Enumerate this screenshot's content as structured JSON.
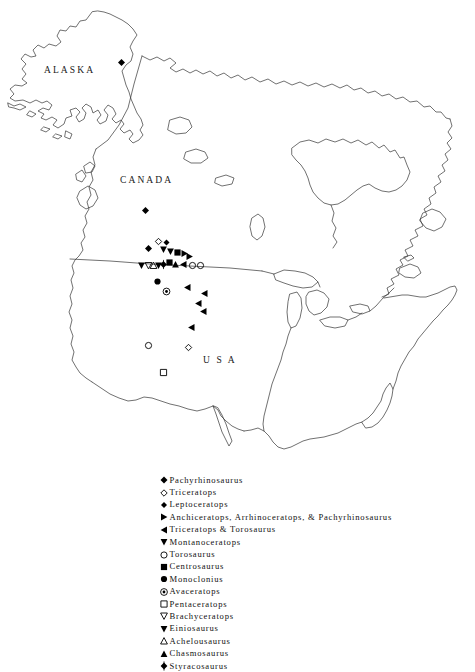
{
  "map": {
    "title": "North American ceratopsian dinosaur fossil localities",
    "background_color": "#ffffff",
    "line_color": "#333333",
    "marker_color": "#000000",
    "region_labels": [
      {
        "name": "alaska",
        "text": "ALASKA"
      },
      {
        "name": "canada",
        "text": "CANADA"
      },
      {
        "name": "usa",
        "text": "U S A"
      }
    ],
    "markers": [
      {
        "symbol": "filled-diamond",
        "taxon": "Pachyrhinosaurus",
        "x": 121,
        "y": 62
      },
      {
        "symbol": "filled-diamond",
        "taxon": "Pachyrhinosaurus",
        "x": 145,
        "y": 210
      },
      {
        "symbol": "filled-diamond",
        "taxon": "Pachyrhinosaurus",
        "x": 148,
        "y": 248
      },
      {
        "symbol": "open-diamond",
        "taxon": "Triceratops",
        "x": 158,
        "y": 241
      },
      {
        "symbol": "filled-diamond-small",
        "taxon": "Leptoceratops",
        "x": 166,
        "y": 242
      },
      {
        "symbol": "filled-down-triangle",
        "taxon": "Montanoceratops",
        "x": 163,
        "y": 249
      },
      {
        "symbol": "filled-down-triangle",
        "taxon": "Montanoceratops",
        "x": 170,
        "y": 251
      },
      {
        "symbol": "filled-square",
        "taxon": "Centrosaurus",
        "x": 177,
        "y": 252
      },
      {
        "symbol": "filled-right-triangle",
        "taxon": "Anchiceratops, Arrhinoceratops, & Pachyrhinosaurus",
        "x": 184,
        "y": 253
      },
      {
        "symbol": "filled-right-triangle",
        "taxon": "Anchiceratops, Arrhinoceratops, & Pachyrhinosaurus",
        "x": 189,
        "y": 256
      },
      {
        "symbol": "filled-down-triangle",
        "taxon": "Montanoceratops",
        "x": 141,
        "y": 265
      },
      {
        "symbol": "open-down-triangle",
        "taxon": "Brachyceratops",
        "x": 148,
        "y": 265
      },
      {
        "symbol": "open-up-triangle",
        "taxon": "Achelousaurus",
        "x": 153,
        "y": 265
      },
      {
        "symbol": "filled-down-triangle",
        "taxon": "Einiosaurus",
        "x": 158,
        "y": 265
      },
      {
        "symbol": "styracosaurus-diamond",
        "taxon": "Styracosaurus",
        "x": 163,
        "y": 264
      },
      {
        "symbol": "filled-square",
        "taxon": "Centrosaurus",
        "x": 169,
        "y": 262
      },
      {
        "symbol": "filled-up-triangle",
        "taxon": "Chasmosaurus",
        "x": 175,
        "y": 264
      },
      {
        "symbol": "filled-left-triangle",
        "taxon": "Triceratops & Torosaurus",
        "x": 183,
        "y": 264
      },
      {
        "symbol": "open-circle",
        "taxon": "Torosaurus",
        "x": 192,
        "y": 265
      },
      {
        "symbol": "open-circle",
        "taxon": "Torosaurus",
        "x": 200,
        "y": 265
      },
      {
        "symbol": "filled-circle",
        "taxon": "Monoclonius",
        "x": 157,
        "y": 281
      },
      {
        "symbol": "avaceratops-circle",
        "taxon": "Avaceratops",
        "x": 166,
        "y": 291
      },
      {
        "symbol": "filled-left-triangle",
        "taxon": "Triceratops & Torosaurus",
        "x": 187,
        "y": 287
      },
      {
        "symbol": "filled-left-triangle",
        "taxon": "Triceratops & Torosaurus",
        "x": 204,
        "y": 293
      },
      {
        "symbol": "filled-left-triangle",
        "taxon": "Triceratops & Torosaurus",
        "x": 198,
        "y": 303
      },
      {
        "symbol": "filled-left-triangle",
        "taxon": "Triceratops & Torosaurus",
        "x": 203,
        "y": 311
      },
      {
        "symbol": "filled-left-triangle",
        "taxon": "Triceratops & Torosaurus",
        "x": 191,
        "y": 327
      },
      {
        "symbol": "open-circle",
        "taxon": "Torosaurus",
        "x": 148,
        "y": 345
      },
      {
        "symbol": "open-diamond",
        "taxon": "Triceratops",
        "x": 188,
        "y": 347
      },
      {
        "symbol": "open-square",
        "taxon": "Pentaceratops",
        "x": 163,
        "y": 372
      }
    ]
  },
  "legend": {
    "entries": [
      {
        "symbol": "filled-diamond",
        "label": "Pachyrhinosaurus"
      },
      {
        "symbol": "open-diamond",
        "label": "Triceratops"
      },
      {
        "symbol": "filled-diamond-small",
        "label": "Leptoceratops"
      },
      {
        "symbol": "filled-right-triangle",
        "label": "Anchiceratops, Arrhinoceratops, & Pachyrhinosaurus"
      },
      {
        "symbol": "filled-left-triangle",
        "label": "Triceratops & Torosaurus"
      },
      {
        "symbol": "filled-down-triangle",
        "label": "Montanoceratops"
      },
      {
        "symbol": "open-circle",
        "label": "Torosaurus"
      },
      {
        "symbol": "filled-square",
        "label": "Centrosaurus"
      },
      {
        "symbol": "filled-circle",
        "label": "Monoclonius"
      },
      {
        "symbol": "avaceratops-circle",
        "label": "Avaceratops"
      },
      {
        "symbol": "open-square",
        "label": "Pentaceratops"
      },
      {
        "symbol": "open-down-triangle",
        "label": "Brachyceratops"
      },
      {
        "symbol": "filled-down-triangle",
        "label": "Einiosaurus"
      },
      {
        "symbol": "open-up-triangle",
        "label": "Achelousaurus"
      },
      {
        "symbol": "filled-up-triangle",
        "label": "Chasmosaurus"
      },
      {
        "symbol": "styracosaurus-diamond",
        "label": "Styracosaurus"
      }
    ]
  }
}
